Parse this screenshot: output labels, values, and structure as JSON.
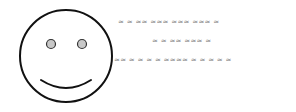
{
  "illustration": {
    "subject": "smiley-face",
    "stroke_color": "#111111",
    "eye_fill": "#c8c8c8",
    "text_color": "#808080"
  },
  "text_lines": [
    "≈ ≈ ≈≈ ≈≈≈ ≈≈≈ ≈≈≈ ≈",
    "≈ ≈ ≈≈ ≈≈≈ ≈",
    "≈≈ ≈ ≈ ≈ ≈ ≈≈≈≈ ≈ ≈ ≈ ≈ ≈"
  ]
}
